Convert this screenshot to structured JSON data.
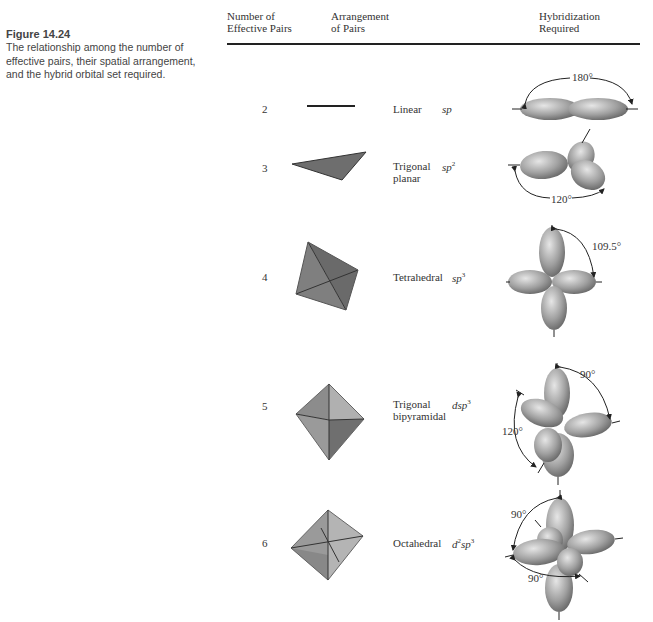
{
  "caption": {
    "title": "Figure 14.24",
    "text": "The relationship among the number of effective pairs, their spatial arrangement, and the hybrid orbital set required."
  },
  "table": {
    "headers": {
      "col1_line1": "Number of",
      "col1_line2": "Effective Pairs",
      "col2_line1": "Arrangement",
      "col2_line2": "of Pairs",
      "col3_line1": "Hybridization",
      "col3_line2": "Required"
    },
    "rows": [
      {
        "pairs": "2",
        "arrangement_line1": "Linear",
        "arrangement_line2": "",
        "hyb_base": "sp",
        "hyb_sup": "",
        "hyb_prefix": "",
        "hyb_prefix_sup": "",
        "angles": [
          "180°"
        ]
      },
      {
        "pairs": "3",
        "arrangement_line1": "Trigonal",
        "arrangement_line2": "planar",
        "hyb_base": "sp",
        "hyb_sup": "2",
        "hyb_prefix": "",
        "hyb_prefix_sup": "",
        "angles": [
          "120°"
        ]
      },
      {
        "pairs": "4",
        "arrangement_line1": "Tetrahedral",
        "arrangement_line2": "",
        "hyb_base": "sp",
        "hyb_sup": "3",
        "hyb_prefix": "",
        "hyb_prefix_sup": "",
        "angles": [
          "109.5°"
        ]
      },
      {
        "pairs": "5",
        "arrangement_line1": "Trigonal",
        "arrangement_line2": "bipyramidal",
        "hyb_base": "sp",
        "hyb_sup": "3",
        "hyb_prefix": "d",
        "hyb_prefix_sup": "",
        "angles": [
          "90°",
          "120°"
        ]
      },
      {
        "pairs": "6",
        "arrangement_line1": "Octahedral",
        "arrangement_line2": "",
        "hyb_base": "sp",
        "hyb_sup": "3",
        "hyb_prefix": "d",
        "hyb_prefix_sup": "2",
        "angles": [
          "90°",
          "90°"
        ]
      }
    ]
  },
  "colors": {
    "orbital_light": "#dcdcdc",
    "orbital_mid": "#a8a8a8",
    "orbital_dark": "#6f6f6f",
    "shape_fill": "#8a8a8a",
    "text": "#333333"
  }
}
